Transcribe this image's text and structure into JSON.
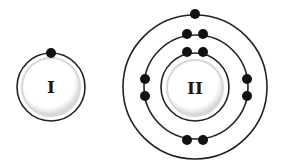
{
  "diagram": {
    "type": "bohr-atom-models",
    "colors": {
      "background": "#ffffff",
      "orbit": "#222222",
      "electron": "#111111",
      "nucleus_fill": "#ffffff",
      "nucleus_shadow": "#d4d4d4"
    },
    "atoms": [
      {
        "label": "I",
        "center": [
          51,
          87
        ],
        "nucleus_radius": 29,
        "shells": [
          {
            "radius": 34,
            "electrons": [
              [
                51,
                53
              ]
            ]
          }
        ]
      },
      {
        "label": "II",
        "center": [
          195,
          87
        ],
        "nucleus_radius": 28,
        "shells": [
          {
            "radius": 33,
            "electrons": [
              [
                187,
                52
              ],
              [
                203,
                52
              ]
            ]
          },
          {
            "radius": 52,
            "electrons": [
              [
                187,
                34
              ],
              [
                203,
                34
              ],
              [
                145,
                79
              ],
              [
                145,
                96
              ],
              [
                247,
                79
              ],
              [
                247,
                96
              ],
              [
                187,
                140
              ],
              [
                203,
                140
              ]
            ]
          },
          {
            "radius": 72,
            "electrons": [
              [
                195,
                14
              ]
            ]
          }
        ]
      }
    ]
  }
}
